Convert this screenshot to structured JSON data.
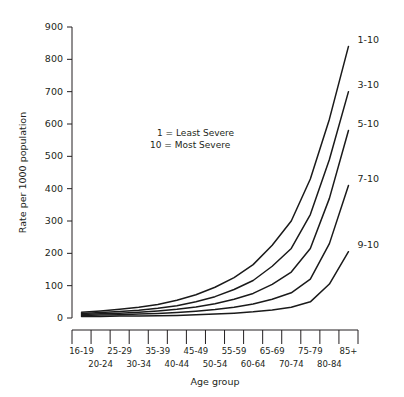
{
  "chart_data": {
    "type": "line",
    "title": "",
    "xlabel": "Age group",
    "ylabel": "Rate per 1000 population",
    "ylim": [
      0,
      900
    ],
    "yticks": [
      0,
      100,
      200,
      300,
      400,
      500,
      600,
      700,
      800,
      900
    ],
    "grid": false,
    "legend_position": "right-endpoint-labels",
    "line_color": "#1a1a1a",
    "categories": [
      "16-19",
      "20-24",
      "25-29",
      "30-34",
      "35-39",
      "40-44",
      "45-49",
      "50-54",
      "55-59",
      "60-64",
      "65-69",
      "70-74",
      "75-79",
      "80-84",
      "85+"
    ],
    "series": [
      {
        "name": "1-10",
        "label": "1-10",
        "values": [
          18,
          22,
          27,
          33,
          42,
          55,
          72,
          95,
          125,
          165,
          225,
          300,
          430,
          615,
          840
        ]
      },
      {
        "name": "3-10",
        "label": "3-10",
        "values": [
          14,
          17,
          20,
          24,
          30,
          38,
          50,
          66,
          88,
          116,
          160,
          215,
          320,
          490,
          700
        ]
      },
      {
        "name": "5-10",
        "label": "5-10",
        "values": [
          11,
          13,
          15,
          18,
          22,
          27,
          34,
          44,
          58,
          76,
          104,
          142,
          215,
          370,
          580
        ]
      },
      {
        "name": "7-10",
        "label": "7-10",
        "values": [
          8,
          9,
          10,
          12,
          14,
          17,
          21,
          26,
          33,
          43,
          58,
          78,
          120,
          230,
          410
        ]
      },
      {
        "name": "9-10",
        "label": "9-10",
        "values": [
          5,
          5,
          6,
          6,
          7,
          8,
          10,
          12,
          15,
          19,
          25,
          33,
          50,
          105,
          205
        ]
      }
    ],
    "annotations": [
      "1 = Least Severe",
      "10 = Most Severe"
    ]
  },
  "notes": {
    "line1": "1 = Least Severe",
    "line2": "10 = Most Severe"
  }
}
